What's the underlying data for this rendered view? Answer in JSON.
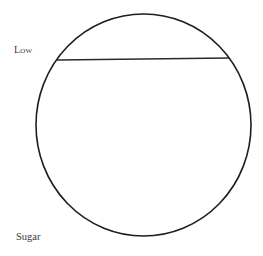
{
  "diagram": {
    "type": "circle-with-chord",
    "labels": {
      "top_left": "Low",
      "bottom_left": "Sugar"
    },
    "circle": {
      "cx": 143.5,
      "cy": 125,
      "rx": 107.5,
      "ry": 111,
      "stroke": "#1e1e1e",
      "stroke_width": 1.6
    },
    "chord": {
      "x1": 57,
      "y1": 60,
      "x2": 229,
      "y2": 58,
      "stroke": "#2a2a2a",
      "stroke_width": 1.4
    }
  }
}
